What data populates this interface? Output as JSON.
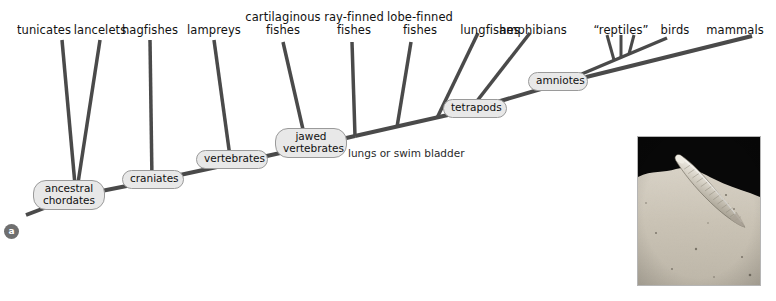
{
  "figure": {
    "panel_label": "a",
    "title_hidden": "Phylogenetic tree of chordates"
  },
  "taxa": [
    {
      "id": "tunicates",
      "label": "tunicates",
      "lines": [
        "tunicates"
      ]
    },
    {
      "id": "lancelets",
      "label": "lancelets",
      "lines": [
        "lancelets"
      ]
    },
    {
      "id": "hagfishes",
      "label": "hagfishes",
      "lines": [
        "hagfishes"
      ]
    },
    {
      "id": "lampreys",
      "label": "lampreys",
      "lines": [
        "lampreys"
      ]
    },
    {
      "id": "cartilaginous-fishes",
      "label": "cartilaginous fishes",
      "lines": [
        "cartilaginous",
        "fishes"
      ]
    },
    {
      "id": "ray-finned-fishes",
      "label": "ray-finned fishes",
      "lines": [
        "ray-finned",
        "fishes"
      ]
    },
    {
      "id": "lobe-finned-fishes",
      "label": "lobe-finned fishes",
      "lines": [
        "lobe-finned",
        "fishes"
      ]
    },
    {
      "id": "lungfishes",
      "label": "lungfishes",
      "lines": [
        "lungfishes"
      ]
    },
    {
      "id": "amphibians",
      "label": "amphibians",
      "lines": [
        "amphibians"
      ]
    },
    {
      "id": "reptiles",
      "label": "“reptiles”",
      "lines": [
        "“reptiles”"
      ]
    },
    {
      "id": "birds",
      "label": "birds",
      "lines": [
        "birds"
      ]
    },
    {
      "id": "mammals",
      "label": "mammals",
      "lines": [
        "mammals"
      ]
    }
  ],
  "nodes": [
    {
      "id": "ancestral-chordates",
      "label": "ancestral chordates",
      "lines": [
        "ancestral",
        "chordates"
      ]
    },
    {
      "id": "craniates",
      "label": "craniates",
      "lines": [
        "craniates"
      ]
    },
    {
      "id": "vertebrates",
      "label": "vertebrates",
      "lines": [
        "vertebrates"
      ]
    },
    {
      "id": "jawed-vertebrates",
      "label": "jawed vertebrates",
      "lines": [
        "jawed",
        "vertebrates"
      ]
    },
    {
      "id": "tetrapods",
      "label": "tetrapods",
      "lines": [
        "tetrapods"
      ]
    },
    {
      "id": "amniotes",
      "label": "amniotes",
      "lines": [
        "amniotes"
      ]
    }
  ],
  "annotations": [
    {
      "id": "lungs-or-swim-bladder",
      "text": "lungs or swim bladder"
    }
  ],
  "inset": {
    "id": "lancelet-photo",
    "caption_hidden": "lancelet partially buried in sand"
  },
  "colors": {
    "branch": "#4a4a4a",
    "node_fill": "#e8e8e8",
    "node_border": "#9a9a9a",
    "text": "#111111",
    "badge_fill": "#6f6f6f",
    "background": "#ffffff"
  }
}
